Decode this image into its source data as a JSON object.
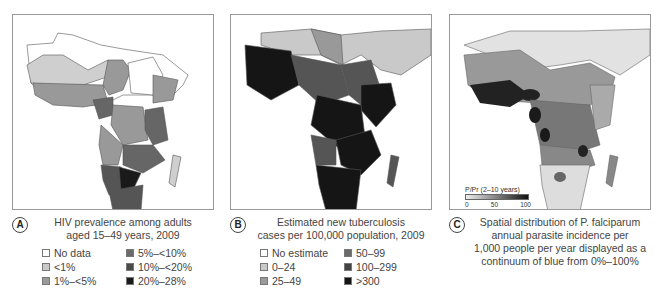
{
  "panels": [
    {
      "id": "A",
      "badge": "A",
      "caption_lines": [
        "HIV prevalence among adults",
        "aged 15–49 years, 2009"
      ],
      "legend": [
        {
          "label": "No data",
          "color": "#ffffff"
        },
        {
          "label": "5%–<10%",
          "color": "#6a6a6a"
        },
        {
          "label": "<1%",
          "color": "#c9c9c9"
        },
        {
          "label": "10%–<20%",
          "color": "#4a4a4a"
        },
        {
          "label": "1%–<5%",
          "color": "#9a9a9a"
        },
        {
          "label": "20%–28%",
          "color": "#1a1a1a"
        }
      ]
    },
    {
      "id": "B",
      "badge": "B",
      "caption_lines": [
        "Estimated new tuberculosis",
        "cases per 100,000 population, 2009"
      ],
      "legend": [
        {
          "label": "No estimate",
          "color": "#ffffff"
        },
        {
          "label": "50–99",
          "color": "#6a6a6a"
        },
        {
          "label": "0–24",
          "color": "#c9c9c9"
        },
        {
          "label": "100–299",
          "color": "#444444"
        },
        {
          "label": "25–49",
          "color": "#9a9a9a"
        },
        {
          "label": ">300",
          "color": "#151515"
        }
      ]
    },
    {
      "id": "C",
      "badge": "C",
      "caption_lines": [
        "Spatial distribution of P. falciparum",
        "annual parasite incidence per",
        "1,000 people per year displayed as a",
        "continuum of blue from 0%–100%"
      ],
      "scale": {
        "title": "P/Pr (2–10 years)",
        "ticks": [
          "0",
          "50",
          "100"
        ]
      }
    }
  ]
}
